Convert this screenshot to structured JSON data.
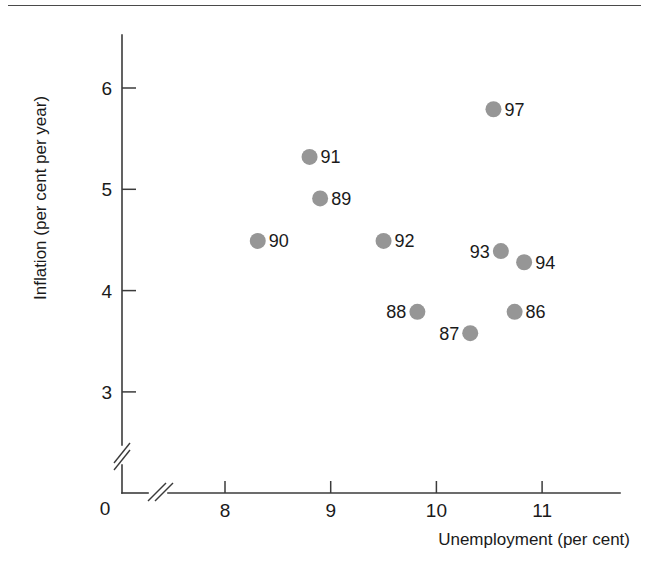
{
  "chart_data": {
    "type": "scatter",
    "title": "",
    "xlabel": "Unemployment (per cent)",
    "ylabel": "Inflation (per cent per year)",
    "xlim": [
      7.55,
      11.35
    ],
    "ylim": [
      2.65,
      6.45
    ],
    "xticks": [
      8,
      9,
      10,
      11
    ],
    "xtick_labels": [
      "8",
      "9",
      "10",
      "11"
    ],
    "yticks": [
      3,
      4,
      5,
      6
    ],
    "ytick_labels": [
      "3",
      "4",
      "5",
      "6"
    ],
    "origin_label": "0",
    "x_axis_break": true,
    "y_axis_break": true,
    "grid": false,
    "legend": "none",
    "marker_color": "#969696",
    "axis_color": "#3b3b3b",
    "points": [
      {
        "label": "86",
        "x": 10.74,
        "y": 3.79,
        "label_side": "right"
      },
      {
        "label": "87",
        "x": 10.32,
        "y": 3.58,
        "label_side": "left"
      },
      {
        "label": "88",
        "x": 9.82,
        "y": 3.79,
        "label_side": "left"
      },
      {
        "label": "89",
        "x": 8.9,
        "y": 4.91,
        "label_side": "right"
      },
      {
        "label": "90",
        "x": 8.31,
        "y": 4.49,
        "label_side": "right"
      },
      {
        "label": "91",
        "x": 8.8,
        "y": 5.32,
        "label_side": "right"
      },
      {
        "label": "92",
        "x": 9.5,
        "y": 4.49,
        "label_side": "right"
      },
      {
        "label": "93",
        "x": 10.61,
        "y": 4.39,
        "label_side": "left"
      },
      {
        "label": "94",
        "x": 10.83,
        "y": 4.28,
        "label_side": "right"
      },
      {
        "label": "97",
        "x": 10.54,
        "y": 5.79,
        "label_side": "right"
      }
    ]
  }
}
